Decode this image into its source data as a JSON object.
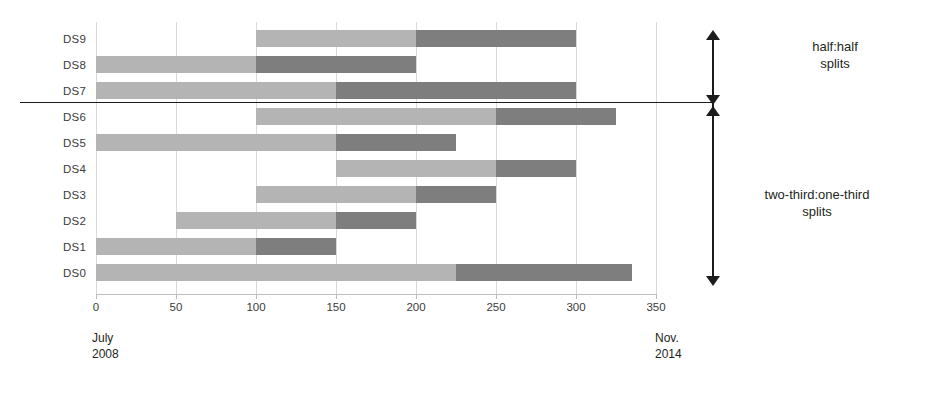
{
  "chart_data": {
    "type": "bar",
    "orientation": "horizontal",
    "subtype": "stacked-gantt-range",
    "title": "",
    "xlabel": "",
    "ylabel": "",
    "xlim": [
      0,
      350
    ],
    "ylim": [
      0,
      10
    ],
    "grid": true,
    "legend_position": "none",
    "xticks": [
      0,
      50,
      100,
      150,
      200,
      250,
      300,
      350
    ],
    "xtick_labels": [
      "0",
      "50",
      "100",
      "150",
      "200",
      "250",
      "300",
      "350"
    ],
    "categories": [
      "DS9",
      "DS8",
      "DS7",
      "DS6",
      "DS5",
      "DS4",
      "DS3",
      "DS2",
      "DS1",
      "DS0"
    ],
    "series": [
      {
        "name": "first-part",
        "color": "#b4b4b4"
      },
      {
        "name": "second-part",
        "color": "#7e7e7e"
      }
    ],
    "bars": [
      {
        "label": "DS9",
        "light_start": 100,
        "light_end": 200,
        "dark_start": 200,
        "dark_end": 300,
        "group": "half:half"
      },
      {
        "label": "DS8",
        "light_start": 0,
        "light_end": 100,
        "dark_start": 100,
        "dark_end": 200,
        "group": "half:half"
      },
      {
        "label": "DS7",
        "light_start": 0,
        "light_end": 150,
        "dark_start": 150,
        "dark_end": 300,
        "group": "half:half"
      },
      {
        "label": "DS6",
        "light_start": 100,
        "light_end": 250,
        "dark_start": 250,
        "dark_end": 325,
        "group": "two-third:one-third"
      },
      {
        "label": "DS5",
        "light_start": 0,
        "light_end": 150,
        "dark_start": 150,
        "dark_end": 225,
        "group": "two-third:one-third"
      },
      {
        "label": "DS4",
        "light_start": 150,
        "light_end": 250,
        "dark_start": 250,
        "dark_end": 300,
        "group": "two-third:one-third"
      },
      {
        "label": "DS3",
        "light_start": 100,
        "light_end": 200,
        "dark_start": 200,
        "dark_end": 250,
        "group": "two-third:one-third"
      },
      {
        "label": "DS2",
        "light_start": 50,
        "light_end": 150,
        "dark_start": 150,
        "dark_end": 200,
        "group": "two-third:one-third"
      },
      {
        "label": "DS1",
        "light_start": 0,
        "light_end": 100,
        "dark_start": 100,
        "dark_end": 150,
        "group": "two-third:one-third"
      },
      {
        "label": "DS0",
        "light_start": 0,
        "light_end": 225,
        "dark_start": 225,
        "dark_end": 335,
        "group": "two-third:one-third"
      }
    ],
    "annotations": [
      {
        "name": "half-half",
        "line1": "half:half",
        "line2": "splits"
      },
      {
        "name": "two-third-one-third",
        "line1": "two-third:one-third",
        "line2": "splits"
      }
    ],
    "axis_captions": {
      "start_line1": "July",
      "start_line2": "2008",
      "end_line1": "Nov.",
      "end_line2": "2014"
    }
  },
  "colors": {
    "light_segment": "#b4b4b4",
    "dark_segment": "#7e7e7e",
    "divider": "#1c1c1c",
    "gridline": "#d9d9d9",
    "text": "#231f20"
  }
}
